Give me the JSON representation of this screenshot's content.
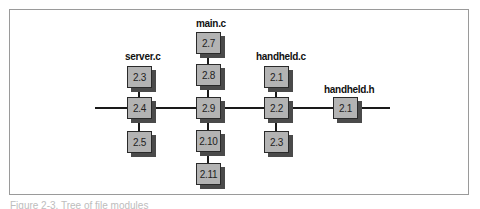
{
  "diagram": {
    "type": "module-tree",
    "groups": [
      {
        "name": "server.c",
        "nodes": [
          "2.3",
          "2.4",
          "2.5"
        ]
      },
      {
        "name": "main.c",
        "nodes": [
          "2.7",
          "2.8",
          "2.9",
          "2.10",
          "2.11"
        ]
      },
      {
        "name": "handheld.c",
        "nodes": [
          "2.1",
          "2.2",
          "2.3"
        ]
      },
      {
        "name": "handheld.h",
        "nodes": [
          "2.1"
        ]
      }
    ],
    "backbone_nodes": [
      "server.c 2.4",
      "main.c 2.9",
      "handheld.c 2.2",
      "handheld.h 2.1"
    ]
  },
  "labels": {
    "server": "server.c",
    "main": "main.c",
    "handheld_c": "handheld.c",
    "handheld_h": "handheld.h"
  },
  "nodes": {
    "server": [
      "2.3",
      "2.4",
      "2.5"
    ],
    "main": [
      "2.7",
      "2.8",
      "2.9",
      "2.10",
      "2.11"
    ],
    "handheld_c": [
      "2.1",
      "2.2",
      "2.3"
    ],
    "handheld_h": [
      "2.1"
    ]
  },
  "caption": "Figure 2-3. Tree of file modules"
}
